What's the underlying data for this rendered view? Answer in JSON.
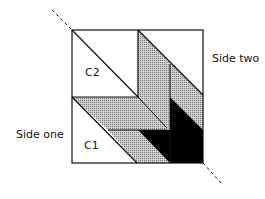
{
  "labels": {
    "c2": "C2",
    "c1": "C1",
    "side_two": "Side two",
    "side_one": "Side one"
  },
  "colors": {
    "line": "#111111",
    "shade": "#b8b8b8",
    "dark": "#000000",
    "background": "#ffffff"
  }
}
